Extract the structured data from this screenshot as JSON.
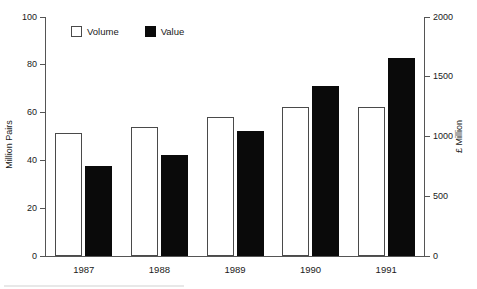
{
  "chart_data": {
    "type": "bar",
    "title": "",
    "subtitle": "",
    "xlabel": "",
    "categories": [
      "1987",
      "1988",
      "1989",
      "1990",
      "1991"
    ],
    "series": [
      {
        "name": "Volume",
        "axis": "left",
        "unit": "Million Pairs",
        "values": [
          51.5,
          54,
          58,
          62.5,
          62.5
        ],
        "fill": "#ffffff",
        "stroke": "#4a4a4a"
      },
      {
        "name": "Value",
        "axis": "right",
        "unit": "£ Million",
        "values": [
          750,
          845,
          1050,
          1425,
          1660
        ],
        "fill": "#0a0a0a",
        "stroke": "#0a0a0a"
      }
    ],
    "axes": {
      "left": {
        "label": "Million Pairs",
        "ticks": [
          "0",
          "20",
          "40",
          "60",
          "80",
          "100"
        ],
        "ylim": [
          0,
          100
        ]
      },
      "right": {
        "label": "£ Million",
        "ticks": [
          "0",
          "500",
          "1000",
          "1500",
          "2000"
        ],
        "ylim": [
          0,
          2000
        ]
      }
    },
    "grid": false,
    "legend": {
      "position": "top-left",
      "entries": [
        "Volume",
        "Value"
      ]
    }
  },
  "legend": {
    "items": [
      {
        "label": "Volume",
        "swatch": "open-square-swatch"
      },
      {
        "label": "Value",
        "swatch": "filled-square-swatch"
      }
    ]
  },
  "axis_left": {
    "title": "Million Pairs",
    "ticks": [
      {
        "label": "100"
      },
      {
        "label": "80"
      },
      {
        "label": "60"
      },
      {
        "label": "40"
      },
      {
        "label": "20"
      },
      {
        "label": "0"
      }
    ]
  },
  "axis_right": {
    "title": "£ Million",
    "ticks": [
      {
        "label": "2000"
      },
      {
        "label": "1500"
      },
      {
        "label": "1000"
      },
      {
        "label": "500"
      },
      {
        "label": "0"
      }
    ]
  },
  "categories": [
    {
      "label": "1987"
    },
    {
      "label": "1988"
    },
    {
      "label": "1989"
    },
    {
      "label": "1990"
    },
    {
      "label": "1991"
    }
  ]
}
